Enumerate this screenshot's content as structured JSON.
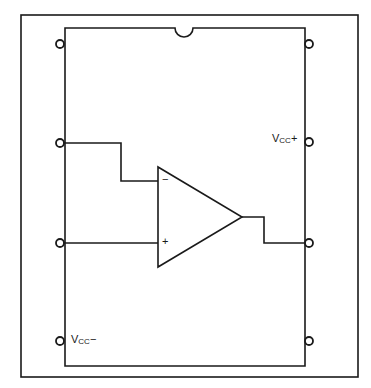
{
  "diagram": {
    "colors": {
      "line": "#1a1a1a",
      "background": "#ffffff"
    },
    "package": {
      "type": "8-pin DIP",
      "notch": "top-center"
    },
    "labels": {
      "vcc_plus": {
        "main": "V",
        "sub": "CC",
        "suffix": "+"
      },
      "vcc_minus": {
        "main": "V",
        "sub": "CC",
        "suffix": "−"
      },
      "inverting_input": "−",
      "noninverting_input": "+"
    },
    "pins": [
      {
        "number": 1,
        "side": "left",
        "connection": "none"
      },
      {
        "number": 2,
        "side": "left",
        "connection": "inverting input"
      },
      {
        "number": 3,
        "side": "left",
        "connection": "non-inverting input"
      },
      {
        "number": 4,
        "side": "left",
        "connection": "Vcc−"
      },
      {
        "number": 5,
        "side": "right",
        "connection": "none"
      },
      {
        "number": 6,
        "side": "right",
        "connection": "output"
      },
      {
        "number": 7,
        "side": "right",
        "connection": "Vcc+"
      },
      {
        "number": 8,
        "side": "right",
        "connection": "none"
      }
    ]
  }
}
